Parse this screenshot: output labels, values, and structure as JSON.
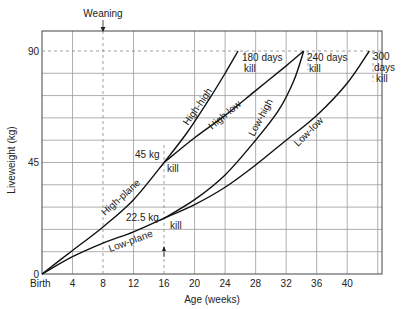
{
  "chart_data": {
    "type": "line",
    "title": "",
    "xlabel": "Age (weeks)",
    "ylabel": "Liveweight (kg)",
    "xlim": [
      0,
      44.6
    ],
    "ylim": [
      0,
      98
    ],
    "grid": true,
    "x_ticks": [
      {
        "value": 0,
        "label": "Birth"
      },
      {
        "value": 4,
        "label": "4"
      },
      {
        "value": 8,
        "label": "8"
      },
      {
        "value": 12,
        "label": "12"
      },
      {
        "value": 16,
        "label": "16"
      },
      {
        "value": 20,
        "label": "20"
      },
      {
        "value": 24,
        "label": "24"
      },
      {
        "value": 28,
        "label": "28"
      },
      {
        "value": 32,
        "label": "32"
      },
      {
        "value": 36,
        "label": "36"
      },
      {
        "value": 40,
        "label": "40"
      }
    ],
    "y_ticks": [
      {
        "value": 0,
        "label": "0"
      },
      {
        "value": 45,
        "label": "45"
      },
      {
        "value": 90,
        "label": "90"
      }
    ],
    "series": [
      {
        "name": "High-plane",
        "x": [
          0,
          4,
          8,
          12,
          16
        ],
        "y": [
          0,
          9.5,
          19,
          30,
          45
        ]
      },
      {
        "name": "Low-plane",
        "x": [
          0,
          4,
          8,
          12,
          16
        ],
        "y": [
          0,
          7,
          12.5,
          17,
          22.5
        ]
      },
      {
        "name": "High-high",
        "x": [
          16,
          19,
          22,
          24,
          25.7
        ],
        "y": [
          45,
          57,
          71,
          81,
          90
        ]
      },
      {
        "name": "High-low",
        "x": [
          16,
          20,
          24,
          28,
          32,
          34.3
        ],
        "y": [
          45,
          55,
          64,
          74,
          84,
          90
        ]
      },
      {
        "name": "Low-high",
        "x": [
          16,
          20,
          24,
          28,
          31,
          33,
          34.3
        ],
        "y": [
          22.5,
          30,
          40,
          54,
          66,
          78,
          90
        ]
      },
      {
        "name": "Low-low",
        "x": [
          16,
          20,
          24,
          28,
          32,
          36,
          40,
          42.9
        ],
        "y": [
          22.5,
          28,
          35,
          44,
          54,
          64,
          77,
          90
        ]
      }
    ],
    "annotations": [
      {
        "text": "Weaning",
        "x": 8,
        "note": "arrow at top pointing down at 8 weeks"
      },
      {
        "text": "45 kg",
        "x": 16,
        "y": 45
      },
      {
        "text": "kill",
        "x": 16,
        "y": 45
      },
      {
        "text": "22.5 kg",
        "x": 16,
        "y": 22.5
      },
      {
        "text": "kill",
        "x": 16,
        "y": 22.5
      },
      {
        "text": "180 days kill",
        "x": 25.7,
        "y": 90
      },
      {
        "text": "240 days kill",
        "x": 34.3,
        "y": 90
      },
      {
        "text": "300 days kill",
        "x": 42.9,
        "y": 90
      }
    ]
  },
  "labels": {
    "weaning": "Weaning",
    "xlabel": "Age (weeks)",
    "ylabel": "Liveweight (kg)",
    "kg45": "45 kg",
    "kill": "kill",
    "kg225": "22.5 kg",
    "days180": "180 days",
    "days240": "240 days",
    "days300": "300",
    "days": "days",
    "high_plane": "High-plane",
    "low_plane": "Low-plane",
    "high_high": "High-high",
    "high_low": "High-low",
    "low_high": "Low-high",
    "low_low": "Low-low"
  }
}
